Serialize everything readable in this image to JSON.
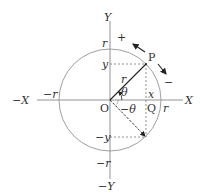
{
  "diagram": {
    "colors": {
      "circle": "#888888",
      "axis": "#777777",
      "radius": "#222222",
      "dashed": "#666666",
      "text": "#333333"
    },
    "labels": {
      "y_axis_pos": "Y",
      "y_axis_neg": "−Y",
      "x_axis_pos": "X",
      "x_axis_neg": "−X",
      "r_top": "r",
      "r_bottom": "−r",
      "r_left": "−r",
      "r_right": "r",
      "plus": "+",
      "minus": "−",
      "point_p": "P",
      "y_coord": "y",
      "neg_y_coord": "−y",
      "radius": "r",
      "theta": "θ",
      "neg_theta": "−θ",
      "x_coord": "x",
      "origin": "O",
      "point_q": "Q"
    }
  }
}
